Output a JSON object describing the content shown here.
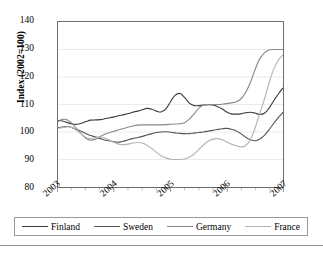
{
  "chart_data": {
    "type": "line",
    "title": "",
    "xlabel": "",
    "ylabel": "Index (2002=100)",
    "ylim": [
      80,
      140
    ],
    "yticks": [
      80,
      90,
      100,
      110,
      120,
      130,
      140
    ],
    "xlim": [
      2003,
      2007
    ],
    "xticks": [
      "2003",
      "2004",
      "2005",
      "2006",
      "2007"
    ],
    "grid": "horizontal",
    "legend_position": "bottom",
    "x": [
      2003.0,
      2003.08,
      2003.17,
      2003.25,
      2003.33,
      2003.42,
      2003.5,
      2003.58,
      2003.67,
      2003.75,
      2003.83,
      2003.92,
      2004.0,
      2004.08,
      2004.17,
      2004.25,
      2004.33,
      2004.42,
      2004.5,
      2004.58,
      2004.67,
      2004.75,
      2004.83,
      2004.92,
      2005.0,
      2005.08,
      2005.17,
      2005.25,
      2005.33,
      2005.42,
      2005.5,
      2005.58,
      2005.67,
      2005.75,
      2005.83,
      2005.92,
      2006.0,
      2006.08,
      2006.17,
      2006.25,
      2006.33,
      2006.42,
      2006.5,
      2006.58,
      2006.67,
      2006.75,
      2006.83,
      2006.92,
      2007.0
    ],
    "series": [
      {
        "name": "Finland",
        "color": "#3b3b3b",
        "values": [
          104.2,
          104.0,
          103.4,
          102.9,
          102.8,
          103.2,
          103.8,
          104.3,
          104.4,
          104.5,
          104.8,
          105.2,
          105.5,
          105.9,
          106.3,
          106.7,
          107.2,
          107.6,
          108.1,
          108.6,
          108.3,
          107.6,
          107.3,
          108.4,
          111.0,
          113.3,
          114.0,
          112.6,
          110.6,
          109.6,
          109.6,
          109.8,
          109.9,
          109.8,
          109.3,
          108.4,
          107.3,
          106.6,
          106.5,
          106.6,
          107.0,
          107.2,
          106.9,
          106.4,
          106.8,
          108.6,
          111.2,
          113.9,
          116.0
        ]
      },
      {
        "name": "Sweden",
        "color": "#555555",
        "values": [
          101.6,
          101.8,
          102.0,
          101.6,
          100.9,
          100.2,
          99.4,
          98.7,
          98.2,
          97.6,
          97.1,
          96.8,
          96.4,
          96.3,
          96.7,
          97.2,
          97.6,
          98.0,
          98.4,
          98.9,
          99.4,
          99.8,
          100.0,
          100.1,
          99.9,
          99.7,
          99.5,
          99.4,
          99.4,
          99.6,
          99.8,
          100.0,
          100.3,
          100.6,
          100.9,
          101.2,
          101.3,
          101.0,
          100.4,
          99.4,
          98.2,
          97.2,
          96.8,
          97.4,
          98.8,
          100.8,
          103.0,
          105.3,
          107.1
        ]
      },
      {
        "name": "Germany",
        "color": "#8a8a8a",
        "values": [
          103.8,
          104.6,
          104.4,
          103.1,
          101.2,
          99.2,
          97.6,
          97.0,
          97.4,
          98.4,
          99.2,
          99.8,
          100.3,
          100.8,
          101.3,
          101.8,
          102.2,
          102.5,
          102.6,
          102.6,
          102.6,
          102.6,
          102.6,
          102.7,
          102.8,
          102.9,
          103.0,
          103.4,
          104.6,
          106.6,
          108.6,
          109.7,
          110.0,
          110.0,
          110.0,
          110.1,
          110.3,
          110.6,
          111.0,
          112.0,
          114.2,
          118.0,
          122.5,
          126.4,
          128.8,
          129.8,
          130.0,
          130.0,
          130.0
        ]
      },
      {
        "name": "France",
        "color": "#b4b4b4",
        "values": [
          101.4,
          101.6,
          101.9,
          101.6,
          100.6,
          99.2,
          98.0,
          97.6,
          98.0,
          98.2,
          97.8,
          97.0,
          96.2,
          95.6,
          95.4,
          95.6,
          96.0,
          96.2,
          96.0,
          95.2,
          94.0,
          92.6,
          91.4,
          90.6,
          90.1,
          90.0,
          90.0,
          90.2,
          90.8,
          92.0,
          93.6,
          95.2,
          96.6,
          97.4,
          97.6,
          97.2,
          96.4,
          95.6,
          95.0,
          94.6,
          95.0,
          97.2,
          101.2,
          106.4,
          112.0,
          117.6,
          122.6,
          126.2,
          128.0
        ]
      }
    ]
  },
  "legend": {
    "items": [
      {
        "label": "Finland"
      },
      {
        "label": "Sweden"
      },
      {
        "label": "Germany"
      },
      {
        "label": "France"
      }
    ]
  }
}
